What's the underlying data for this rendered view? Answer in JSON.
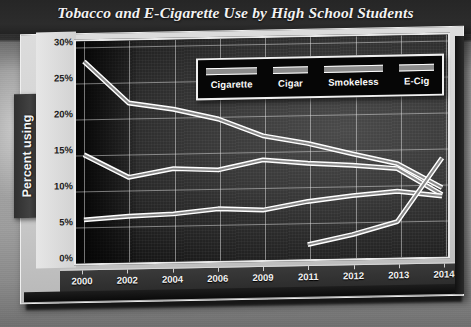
{
  "chart_data": {
    "type": "line",
    "title": "Tobacco and E-Cigarette Use by High School Students",
    "xlabel": "",
    "ylabel": "Percent using",
    "x": [
      "2000",
      "2002",
      "2004",
      "2006",
      "2009",
      "2011",
      "2012",
      "2013",
      "2014"
    ],
    "ylim": [
      0,
      30
    ],
    "ytick_labels": [
      "0%",
      "5%",
      "10%",
      "15%",
      "20%",
      "25%",
      "30%"
    ],
    "ytick_values": [
      0,
      5,
      10,
      15,
      20,
      25,
      30
    ],
    "grid": true,
    "legend_position": "top-center-inside",
    "series": [
      {
        "name": "Cigarette",
        "color": "#d8d8d8",
        "values": [
          28.0,
          22.0,
          21.0,
          19.5,
          17.0,
          15.8,
          14.2,
          12.7,
          9.2
        ]
      },
      {
        "name": "Cigar",
        "color": "#d8d8d8",
        "values": [
          14.8,
          11.5,
          12.6,
          12.3,
          13.6,
          13.0,
          12.6,
          12.0,
          8.2
        ]
      },
      {
        "name": "Smokeless",
        "color": "#d8d8d8",
        "values": [
          5.6,
          6.0,
          6.2,
          6.8,
          6.5,
          7.6,
          8.3,
          8.8,
          8.0
        ]
      },
      {
        "name": "E-Cig",
        "color": "#d8d8d8",
        "values": [
          null,
          null,
          null,
          null,
          null,
          1.5,
          2.8,
          4.5,
          13.4
        ]
      }
    ]
  },
  "chart": {
    "title": "Tobacco and E-Cigarette Use by High School Students",
    "y_axis_title": "Percent using",
    "y_ticks": [
      "30%",
      "25%",
      "20%",
      "15%",
      "10%",
      "5%",
      "0%"
    ],
    "x_ticks": [
      "2000",
      "2002",
      "2004",
      "2006",
      "2009",
      "2011",
      "2012",
      "2013",
      "2014"
    ],
    "legend": [
      {
        "label": "Cigarette"
      },
      {
        "label": "Cigar"
      },
      {
        "label": "Smokeless"
      },
      {
        "label": "E-Cig"
      }
    ]
  },
  "colors": {
    "line": "#d8d8d8",
    "plot_background": "#2f2f2f",
    "panel": "#d4d4d4",
    "title_text": "#f2f2f2"
  }
}
